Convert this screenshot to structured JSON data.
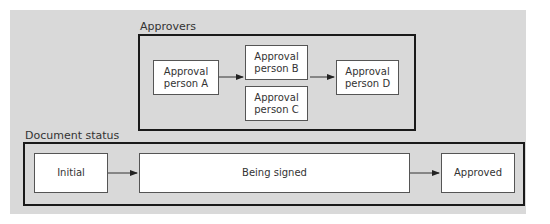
{
  "approvers": {
    "label": "Approvers",
    "nodes": [
      {
        "id": "A",
        "label": "Approval\nperson A"
      },
      {
        "id": "B",
        "label": "Approval\nperson B"
      },
      {
        "id": "C",
        "label": "Approval\nperson C"
      },
      {
        "id": "D",
        "label": "Approval\nperson D"
      }
    ],
    "edges": [
      [
        "A",
        "B"
      ],
      [
        "B",
        "D"
      ]
    ]
  },
  "document_status": {
    "label": "Document status",
    "nodes": [
      {
        "id": "initial",
        "label": "Initial"
      },
      {
        "id": "signed",
        "label": "Being signed"
      },
      {
        "id": "approved",
        "label": "Approved"
      }
    ],
    "edges": [
      [
        "initial",
        "signed"
      ],
      [
        "signed",
        "approved"
      ]
    ]
  },
  "colors": {
    "background": "#d9d9d9",
    "group_border": "#1a1a1a",
    "node_fill": "#ffffff",
    "node_border": "#555555"
  }
}
